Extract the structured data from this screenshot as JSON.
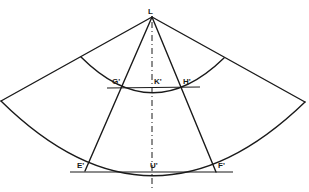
{
  "diagram": {
    "type": "geometric-construction",
    "colors": {
      "stroke": "#1a1a1a",
      "background": "#ffffff"
    },
    "labels": {
      "apex": "L",
      "g": "G'",
      "k": "K'",
      "h": "H'",
      "e": "E'",
      "u": "U'",
      "f": "F'"
    },
    "points": {
      "L": [
        152,
        17
      ],
      "outer_left": [
        0,
        101
      ],
      "outer_right": [
        305,
        102
      ],
      "inner_arc_left": [
        81,
        57
      ],
      "inner_arc_right": [
        224,
        58
      ],
      "G": [
        118,
        87
      ],
      "K": [
        152,
        87
      ],
      "H": [
        187,
        87
      ],
      "E": [
        85,
        171
      ],
      "U": [
        152,
        172
      ],
      "F": [
        216,
        172
      ]
    }
  }
}
